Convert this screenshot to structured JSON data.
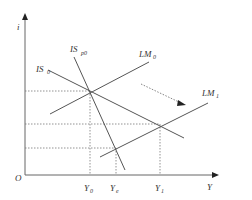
{
  "diagram": {
    "type": "IS-LM diagram",
    "axes": {
      "y_label": "i",
      "x_label": "Y",
      "origin_label": "O"
    },
    "curves": [
      {
        "id": "IS0",
        "label": "IS",
        "subscript": "0"
      },
      {
        "id": "ISp0",
        "label": "IS",
        "subscript": "p0"
      },
      {
        "id": "LM0",
        "label": "LM",
        "subscript": "0"
      },
      {
        "id": "LM1",
        "label": "LM",
        "subscript": "1"
      }
    ],
    "x_ticks": [
      {
        "label": "Y",
        "subscript": "0"
      },
      {
        "label": "Y",
        "subscript": "e"
      },
      {
        "label": "Y",
        "subscript": "1"
      }
    ],
    "shift_arrow": "LM0 shifts to LM1",
    "colors": {
      "line": "#555555",
      "dashed": "#777777",
      "background": "#ffffff"
    }
  }
}
